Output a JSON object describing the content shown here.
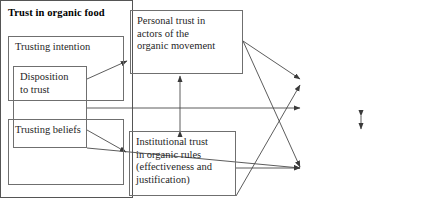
{
  "diagram": {
    "type": "path-model",
    "colors": {
      "box_border": "#6f6f6f",
      "group_border": "#555555",
      "arrow": "#4a4a4a",
      "text": "#1f1f1f",
      "background": "#ffffff"
    },
    "nodes": {
      "disposition": {
        "label": "Disposition\nto trust",
        "x": 13,
        "y": 66,
        "w": 74,
        "h": 82
      },
      "personal": {
        "label": "Personal trust in\nactors of the\norganic movement",
        "x": 130,
        "y": 10,
        "w": 113,
        "h": 64
      },
      "institutional": {
        "label": "Institutional trust\nin organic rules\n(effectiveness and\njustification)",
        "x": 129,
        "y": 131,
        "w": 107,
        "h": 65
      },
      "intention": {
        "label": "Trusting intention",
        "x": 303,
        "y": 48,
        "w": 116,
        "h": 65
      },
      "beliefs": {
        "label": "Trusting beliefs",
        "x": 303,
        "y": 131,
        "w": 116,
        "h": 66
      }
    },
    "group": {
      "label": "Trust in organic food",
      "x": 295,
      "y": 12,
      "w": 131,
      "h": 196
    },
    "edges": [
      {
        "from": "disposition",
        "to": "personal",
        "style": "single-arrow"
      },
      {
        "from": "disposition",
        "to": "institutional",
        "style": "single-arrow"
      },
      {
        "from": "disposition",
        "to": "intention",
        "style": "single-arrow"
      },
      {
        "from": "disposition",
        "to": "beliefs",
        "style": "single-arrow"
      },
      {
        "from": "personal",
        "to": "institutional",
        "style": "double-arrow"
      },
      {
        "from": "personal",
        "to": "intention",
        "style": "single-arrow"
      },
      {
        "from": "personal",
        "to": "beliefs",
        "style": "single-arrow"
      },
      {
        "from": "institutional",
        "to": "intention",
        "style": "single-arrow"
      },
      {
        "from": "institutional",
        "to": "beliefs",
        "style": "single-arrow"
      },
      {
        "from": "intention",
        "to": "beliefs",
        "style": "double-arrow"
      }
    ]
  }
}
